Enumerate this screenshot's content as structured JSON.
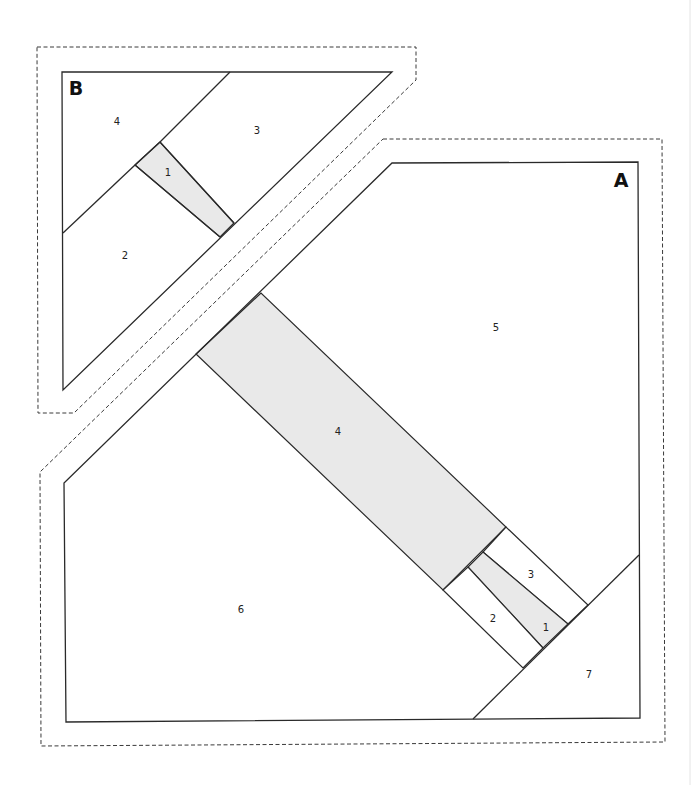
{
  "diagram": {
    "type": "foundation paper piecing template",
    "sections": [
      {
        "label": "B",
        "pieces": [
          {
            "number": "1",
            "shaded": true
          },
          {
            "number": "2",
            "shaded": false
          },
          {
            "number": "3",
            "shaded": false
          },
          {
            "number": "4",
            "shaded": false
          }
        ]
      },
      {
        "label": "A",
        "pieces": [
          {
            "number": "1",
            "shaded": true
          },
          {
            "number": "2",
            "shaded": false
          },
          {
            "number": "3",
            "shaded": false
          },
          {
            "number": "4",
            "shaded": true
          },
          {
            "number": "5",
            "shaded": false
          },
          {
            "number": "6",
            "shaded": false
          },
          {
            "number": "7",
            "shaded": false
          }
        ]
      }
    ],
    "legend": {
      "solid_line": "sewing line",
      "dashed_line": "seam allowance cutting line"
    },
    "colors": {
      "line": "#2a2a2a",
      "shade": "#e9e9e9",
      "background": "#ffffff"
    }
  }
}
